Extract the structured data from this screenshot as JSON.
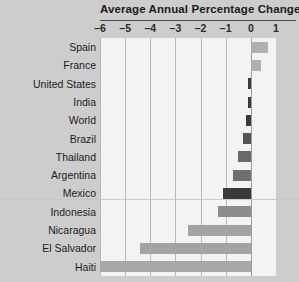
{
  "chart_data": {
    "type": "bar",
    "orientation": "horizontal",
    "title": "Average Annual Percentage Change",
    "xlabel": "",
    "ylabel": "",
    "xlim": [
      -6,
      1
    ],
    "grid": true,
    "legend": null,
    "tick_labels": [
      "–6",
      "–5",
      "–4",
      "–3",
      "–2",
      "–1",
      "0",
      "1"
    ],
    "tick_values": [
      -6,
      -5,
      -4,
      -3,
      -2,
      -1,
      0,
      1
    ],
    "categories": [
      "Spain",
      "France",
      "United States",
      "India",
      "World",
      "Brazil",
      "Thailand",
      "Argentina",
      "Mexico",
      "Indonesia",
      "Nicaragua",
      "El Salvador",
      "Haiti"
    ],
    "values": [
      0.7,
      0.4,
      -0.1,
      -0.1,
      -0.2,
      -0.3,
      -0.5,
      -0.7,
      -1.1,
      -1.3,
      -2.5,
      -4.4,
      -6.0
    ],
    "colors": {
      "positive_bar": "#b0b0b0",
      "small_negative_bar": "#3a3a3a",
      "large_negative_bar": "#a0a0a0",
      "plot_background": "#f3f3f1",
      "page_background": "#cdcdcd",
      "gridline": "#b9b9b9",
      "zero_line": "#9d9d9d",
      "title_rule": "#4a4a4a",
      "text": "#1c1c1c"
    },
    "bars": [
      {
        "label": "Spain",
        "value": 0.7,
        "direction": "positive",
        "color": "#b0b0b0"
      },
      {
        "label": "France",
        "value": 0.4,
        "direction": "positive",
        "color": "#b0b0b0"
      },
      {
        "label": "United States",
        "value": -0.1,
        "direction": "negative",
        "color": "#3a3a3a"
      },
      {
        "label": "India",
        "value": -0.1,
        "direction": "negative",
        "color": "#3a3a3a"
      },
      {
        "label": "World",
        "value": -0.2,
        "direction": "negative",
        "color": "#3a3a3a"
      },
      {
        "label": "Brazil",
        "value": -0.3,
        "direction": "negative",
        "color": "#555555"
      },
      {
        "label": "Thailand",
        "value": -0.5,
        "direction": "negative",
        "color": "#6a6a6a"
      },
      {
        "label": "Argentina",
        "value": -0.7,
        "direction": "negative",
        "color": "#6f6f6f"
      },
      {
        "label": "Mexico",
        "value": -1.1,
        "direction": "negative",
        "color": "#3a3a3a"
      },
      {
        "label": "Indonesia",
        "value": -1.3,
        "direction": "negative",
        "color": "#8c8c8c"
      },
      {
        "label": "Nicaragua",
        "value": -2.5,
        "direction": "negative",
        "color": "#a3a3a3"
      },
      {
        "label": "El Salvador",
        "value": -4.4,
        "direction": "negative",
        "color": "#a3a3a3"
      },
      {
        "label": "Haiti",
        "value": -6.0,
        "direction": "negative",
        "color": "#a8a8a8"
      }
    ]
  }
}
